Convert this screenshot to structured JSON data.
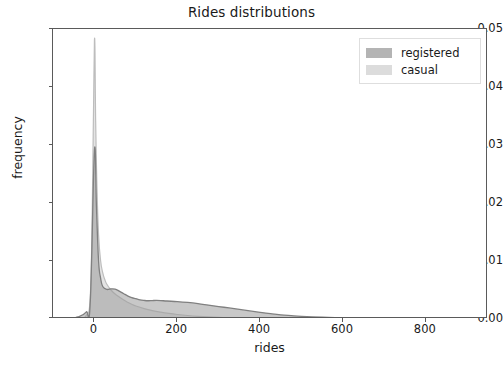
{
  "chart_data": {
    "type": "area",
    "title": "Rides distributions",
    "xlabel": "rides",
    "ylabel": "frequency",
    "xlim": [
      -100,
      950
    ],
    "ylim": [
      0.0,
      0.05
    ],
    "grid": false,
    "legend_position": "upper right",
    "xticks": [
      0,
      200,
      400,
      600,
      800
    ],
    "xtick_labels": [
      "0",
      "200",
      "400",
      "600",
      "800"
    ],
    "yticks": [
      0.0,
      0.01,
      0.02,
      0.03,
      0.04,
      0.05
    ],
    "ytick_labels": [
      "0.00",
      "0.01",
      "0.02",
      "0.03",
      "0.04",
      "0.05"
    ],
    "series": [
      {
        "name": "registered",
        "color": "#9a9a9a",
        "x": [
          -100,
          -80,
          -60,
          -40,
          -20,
          -10,
          0,
          5,
          10,
          15,
          20,
          30,
          40,
          50,
          60,
          70,
          80,
          90,
          100,
          110,
          120,
          130,
          140,
          150,
          160,
          175,
          200,
          225,
          250,
          275,
          300,
          325,
          350,
          375,
          400,
          425,
          450,
          475,
          500,
          550,
          600,
          650,
          700,
          750,
          800,
          850,
          900,
          950
        ],
        "y": [
          2e-05,
          5e-05,
          0.00012,
          0.00035,
          0.0012,
          0.003,
          0.029,
          0.019,
          0.01,
          0.007,
          0.0056,
          0.0051,
          0.0052,
          0.00515,
          0.0048,
          0.0044,
          0.004,
          0.0037,
          0.0035,
          0.0033,
          0.0032,
          0.00315,
          0.00318,
          0.0032,
          0.00318,
          0.0031,
          0.003,
          0.00285,
          0.00265,
          0.0024,
          0.00215,
          0.0019,
          0.00165,
          0.0014,
          0.00115,
          0.00092,
          0.00072,
          0.00058,
          0.00046,
          0.0003,
          0.0002,
          0.00013,
          9e-05,
          6e-05,
          4e-05,
          3e-05,
          2e-05,
          1e-05
        ]
      },
      {
        "name": "casual",
        "color": "#d4d4d4",
        "x": [
          -100,
          -60,
          -40,
          -20,
          -10,
          -5,
          0,
          3,
          6,
          10,
          15,
          20,
          25,
          30,
          40,
          50,
          60,
          70,
          80,
          90,
          100,
          120,
          140,
          160,
          180,
          200,
          225,
          250,
          275,
          300,
          325,
          350,
          375,
          400,
          450,
          500,
          550,
          600,
          650,
          700,
          800,
          900,
          950
        ],
        "y": [
          1e-05,
          3e-05,
          0.0001,
          0.0006,
          0.004,
          0.02,
          0.048,
          0.034,
          0.023,
          0.0145,
          0.01,
          0.008,
          0.0068,
          0.006,
          0.005,
          0.0043,
          0.0038,
          0.0033,
          0.0029,
          0.00255,
          0.00225,
          0.0018,
          0.00145,
          0.00118,
          0.00096,
          0.00078,
          0.0006,
          0.00046,
          0.00035,
          0.00027,
          0.00021,
          0.00016,
          0.00012,
          0.0001,
          6e-05,
          4e-05,
          2e-05,
          1e-05,
          1e-05,
          1e-05,
          0.0,
          0.0,
          0.0
        ]
      }
    ]
  },
  "legend": {
    "items": [
      {
        "label": "registered",
        "swatch_color": "#b4b4b4"
      },
      {
        "label": "casual",
        "swatch_color": "#dcdcdc"
      }
    ]
  },
  "axes": {
    "frame_color": "#5a5a5a",
    "background": "#ffffff"
  }
}
